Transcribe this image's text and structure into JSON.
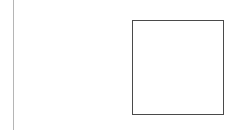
{
  "canvas": {
    "width": 238,
    "height": 131,
    "background": "#ffffff"
  },
  "shapes": {
    "vertical_line": {
      "color": "#b5b5b5",
      "x": 13,
      "y_start": 0,
      "y_end": 130
    },
    "square": {
      "stroke": "#4a4a4a",
      "fill": "#ffffff",
      "x": 132,
      "y": 20,
      "width": 91,
      "height": 94
    }
  }
}
